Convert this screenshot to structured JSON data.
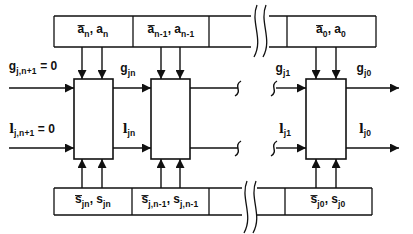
{
  "colors": {
    "line": "#111111",
    "background": "#ffffff"
  },
  "labels": {
    "g_input": {
      "segments": [
        {
          "t": "g",
          "s": "base"
        },
        {
          "t": "j,n+1",
          "s": "sub"
        },
        {
          "t": " = 0",
          "s": "base"
        }
      ]
    },
    "l_input": {
      "segments": [
        {
          "t": "l",
          "s": "ell"
        },
        {
          "t": "j,n+1",
          "s": "sub"
        },
        {
          "t": " = 0",
          "s": "base"
        }
      ]
    },
    "g_jn": {
      "segments": [
        {
          "t": "g",
          "s": "base"
        },
        {
          "t": "jn",
          "s": "sub"
        }
      ]
    },
    "l_jn": {
      "segments": [
        {
          "t": "l",
          "s": "ell"
        },
        {
          "t": "jn",
          "s": "sub"
        }
      ]
    },
    "g_j1": {
      "segments": [
        {
          "t": "g",
          "s": "base"
        },
        {
          "t": "j1",
          "s": "sub"
        }
      ]
    },
    "l_j1": {
      "segments": [
        {
          "t": "l",
          "s": "ell"
        },
        {
          "t": "j1",
          "s": "sub"
        }
      ]
    },
    "g_j0": {
      "segments": [
        {
          "t": "g",
          "s": "base"
        },
        {
          "t": "j0",
          "s": "sub"
        }
      ]
    },
    "l_j0": {
      "segments": [
        {
          "t": "l",
          "s": "ell"
        },
        {
          "t": "j0",
          "s": "sub"
        }
      ]
    }
  },
  "top_row_boxes": [
    {
      "name": "a_n",
      "segments": [
        {
          "t": "a",
          "s": "bar"
        },
        {
          "t": "n",
          "s": "sub"
        },
        {
          "t": ", ",
          "s": "base"
        },
        {
          "t": "a",
          "s": "base"
        },
        {
          "t": "n",
          "s": "sub"
        }
      ]
    },
    {
      "name": "a_n-1",
      "segments": [
        {
          "t": "a",
          "s": "bar"
        },
        {
          "t": "n-1",
          "s": "sub"
        },
        {
          "t": ", ",
          "s": "base"
        },
        {
          "t": "a",
          "s": "base"
        },
        {
          "t": "n-1",
          "s": "sub"
        }
      ]
    },
    {
      "name": "a_0",
      "segments": [
        {
          "t": "a",
          "s": "bar"
        },
        {
          "t": "0",
          "s": "sub"
        },
        {
          "t": ", ",
          "s": "base"
        },
        {
          "t": "a",
          "s": "base"
        },
        {
          "t": "0",
          "s": "sub"
        }
      ]
    }
  ],
  "bottom_row_boxes": [
    {
      "name": "s_jn",
      "segments": [
        {
          "t": "s",
          "s": "bar"
        },
        {
          "t": "jn",
          "s": "sub"
        },
        {
          "t": ", ",
          "s": "base"
        },
        {
          "t": "s",
          "s": "base"
        },
        {
          "t": "jn",
          "s": "sub"
        }
      ]
    },
    {
      "name": "s_j,n-1",
      "segments": [
        {
          "t": "s",
          "s": "bar"
        },
        {
          "t": "j,n-1",
          "s": "sub"
        },
        {
          "t": ", ",
          "s": "base"
        },
        {
          "t": "s",
          "s": "base"
        },
        {
          "t": "j,n-1",
          "s": "sub"
        }
      ]
    },
    {
      "name": "s_j0",
      "segments": [
        {
          "t": "s",
          "s": "bar"
        },
        {
          "t": "j0",
          "s": "sub"
        },
        {
          "t": ", ",
          "s": "base"
        },
        {
          "t": "s",
          "s": "base"
        },
        {
          "t": "j0",
          "s": "sub"
        }
      ]
    }
  ]
}
